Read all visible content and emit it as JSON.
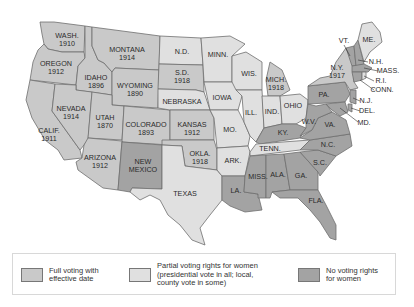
{
  "colors": {
    "full": "#c9c9c9",
    "partial": "#e0e0e0",
    "none": "#a3a3a3",
    "border": "#6e6e6e"
  },
  "states": [
    {
      "id": "wa",
      "label": "WASH.",
      "year": "1910",
      "status": "full"
    },
    {
      "id": "or",
      "label": "OREGON",
      "year": "1912",
      "status": "full"
    },
    {
      "id": "ca",
      "label": "CALIF.",
      "year": "1911",
      "status": "full"
    },
    {
      "id": "id",
      "label": "IDAHO",
      "year": "1896",
      "status": "full"
    },
    {
      "id": "nv",
      "label": "NEVADA",
      "year": "1914",
      "status": "full"
    },
    {
      "id": "mt",
      "label": "MONTANA",
      "year": "1914",
      "status": "full"
    },
    {
      "id": "wy",
      "label": "WYOMING",
      "year": "1890",
      "status": "full"
    },
    {
      "id": "ut",
      "label": "UTAH",
      "year": "1870",
      "status": "full"
    },
    {
      "id": "az",
      "label": "ARIZONA",
      "year": "1912",
      "status": "full"
    },
    {
      "id": "co",
      "label": "COLORADO",
      "year": "1893",
      "status": "full"
    },
    {
      "id": "nm",
      "label": "NEW MEXICO",
      "year": "",
      "status": "none"
    },
    {
      "id": "nd",
      "label": "N.D.",
      "year": "",
      "status": "partial"
    },
    {
      "id": "sd",
      "label": "S.D.",
      "year": "1918",
      "status": "full"
    },
    {
      "id": "ne",
      "label": "NEBRASKA",
      "year": "",
      "status": "partial"
    },
    {
      "id": "ks",
      "label": "KANSAS",
      "year": "1912",
      "status": "full"
    },
    {
      "id": "ok",
      "label": "OKLA.",
      "year": "1918",
      "status": "full"
    },
    {
      "id": "tx",
      "label": "TEXAS",
      "year": "",
      "status": "partial"
    },
    {
      "id": "mn",
      "label": "MINN.",
      "year": "",
      "status": "partial"
    },
    {
      "id": "ia",
      "label": "IOWA",
      "year": "",
      "status": "partial"
    },
    {
      "id": "mo",
      "label": "MO.",
      "year": "",
      "status": "partial"
    },
    {
      "id": "ar",
      "label": "ARK.",
      "year": "",
      "status": "partial"
    },
    {
      "id": "la",
      "label": "LA.",
      "year": "",
      "status": "none"
    },
    {
      "id": "wi",
      "label": "WIS.",
      "year": "",
      "status": "partial"
    },
    {
      "id": "il",
      "label": "ILL.",
      "year": "",
      "status": "partial"
    },
    {
      "id": "mi",
      "label": "MICH.",
      "year": "1918",
      "status": "full"
    },
    {
      "id": "in",
      "label": "IND.",
      "year": "",
      "status": "partial"
    },
    {
      "id": "oh",
      "label": "OHIO",
      "year": "",
      "status": "partial"
    },
    {
      "id": "ky",
      "label": "KY.",
      "year": "",
      "status": "none"
    },
    {
      "id": "tn",
      "label": "TENN.",
      "year": "",
      "status": "partial"
    },
    {
      "id": "ms",
      "label": "MISS.",
      "year": "",
      "status": "none"
    },
    {
      "id": "al",
      "label": "ALA.",
      "year": "",
      "status": "none"
    },
    {
      "id": "ga",
      "label": "GA.",
      "year": "",
      "status": "none"
    },
    {
      "id": "fl",
      "label": "FLA.",
      "year": "",
      "status": "none"
    },
    {
      "id": "sc",
      "label": "S.C.",
      "year": "",
      "status": "none"
    },
    {
      "id": "nc",
      "label": "N.C.",
      "year": "",
      "status": "none"
    },
    {
      "id": "va",
      "label": "VA.",
      "year": "",
      "status": "none"
    },
    {
      "id": "wv",
      "label": "W.V.",
      "year": "",
      "status": "none"
    },
    {
      "id": "pa",
      "label": "PA.",
      "year": "",
      "status": "none"
    },
    {
      "id": "ny",
      "label": "N.Y.",
      "year": "1917",
      "status": "full"
    },
    {
      "id": "vt",
      "label": "VT.",
      "year": "",
      "status": "none"
    },
    {
      "id": "nh",
      "label": "N.H.",
      "year": "",
      "status": "none"
    },
    {
      "id": "me",
      "label": "ME.",
      "year": "",
      "status": "partial"
    },
    {
      "id": "ma",
      "label": "MASS.",
      "year": "",
      "status": "none"
    },
    {
      "id": "ri",
      "label": "R.I.",
      "year": "",
      "status": "partial"
    },
    {
      "id": "ct",
      "label": "CONN.",
      "year": "",
      "status": "none"
    },
    {
      "id": "nj",
      "label": "N.J.",
      "year": "",
      "status": "none"
    },
    {
      "id": "de",
      "label": "DEL.",
      "year": "",
      "status": "none"
    },
    {
      "id": "md",
      "label": "MD.",
      "year": "",
      "status": "none"
    }
  ],
  "legend": {
    "items": [
      {
        "label": "Full voting with\neffective date",
        "status": "full"
      },
      {
        "label": "Partial voting rights for women\n(presidential vote in all; local,\ncounty vote in some)",
        "status": "partial"
      },
      {
        "label": "No voting rights\nfor women",
        "status": "none"
      }
    ]
  }
}
